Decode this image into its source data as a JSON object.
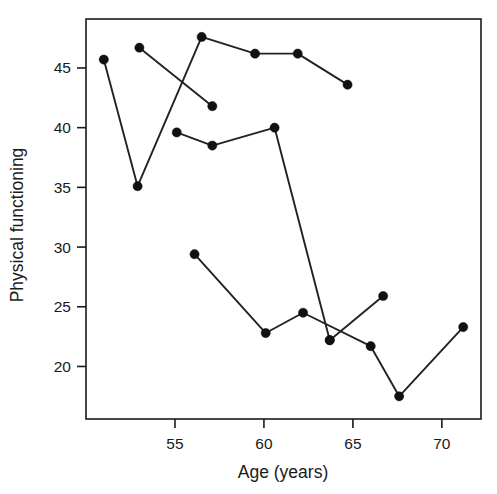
{
  "chart_data": {
    "type": "line",
    "title": "",
    "xlabel": "Age (years)",
    "ylabel": "Physical functioning",
    "xlim": [
      50.0,
      72.2
    ],
    "ylim": [
      15.6,
      49.1
    ],
    "xticks": [
      55,
      60,
      65,
      70
    ],
    "xtick_labels": [
      "55",
      "60",
      "65",
      "70"
    ],
    "yticks": [
      20,
      25,
      30,
      35,
      40,
      45
    ],
    "ytick_labels": [
      "20",
      "25",
      "30",
      "35",
      "40",
      "45"
    ],
    "grid": false,
    "legend": false,
    "marker": "filled-circle",
    "marker_color": "#111111",
    "line_color": "#222222",
    "series": [
      {
        "name": "series-1",
        "x": [
          51.0,
          52.9,
          56.5,
          59.5,
          61.9,
          64.7
        ],
        "y": [
          45.7,
          35.1,
          47.6,
          46.2,
          46.2,
          43.6
        ]
      },
      {
        "name": "series-2",
        "x": [
          53.0,
          57.1
        ],
        "y": [
          46.7,
          41.8
        ]
      },
      {
        "name": "series-3",
        "x": [
          55.1,
          57.1,
          60.6,
          63.7
        ],
        "y": [
          39.6,
          38.5,
          40.0,
          22.2
        ]
      },
      {
        "name": "series-4",
        "x": [
          56.1,
          60.1,
          62.2,
          66.0,
          67.6,
          71.2
        ],
        "y": [
          29.4,
          22.8,
          24.5,
          21.7,
          17.5,
          23.3
        ]
      },
      {
        "name": "series-5",
        "x": [
          63.7,
          66.7
        ],
        "y": [
          22.2,
          25.9
        ]
      }
    ]
  },
  "axes": {
    "frame_color": "#1a1a1a"
  }
}
